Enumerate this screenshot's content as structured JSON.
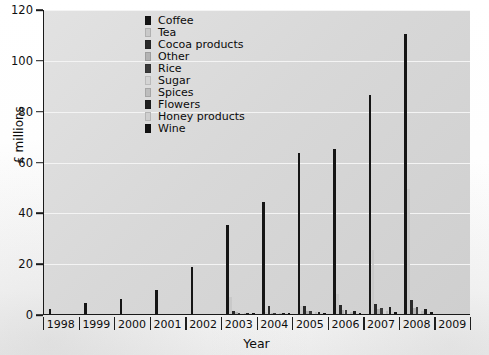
{
  "chart_data": {
    "type": "bar",
    "title": "",
    "subtitle": "",
    "xlabel": "Year",
    "ylabel": "£ millions",
    "ylim": [
      0,
      120
    ],
    "yticks": [
      0,
      20,
      40,
      60,
      80,
      100,
      120
    ],
    "grid": true,
    "legend_position": "top-left-inside",
    "categories": [
      "1998",
      "1999",
      "2000",
      "2001",
      "2002",
      "2003",
      "2004",
      "2005",
      "2006",
      "2007",
      "2008",
      "2009"
    ],
    "series": [
      {
        "name": "Coffee",
        "color": "#151515",
        "values": [
          2.0,
          4.5,
          6.0,
          9.5,
          18.5,
          35.0,
          44.0,
          63.5,
          65.0,
          86.0,
          110.0,
          0
        ]
      },
      {
        "name": "Tea",
        "color": "#c9c9c9",
        "values": [
          0,
          0,
          0,
          0,
          0,
          6.8,
          0.8,
          3.0,
          8.0,
          25.0,
          49.0,
          0
        ]
      },
      {
        "name": "Cocoa products",
        "color": "#2a2a2a",
        "values": [
          0,
          0,
          0,
          0,
          0,
          1.2,
          3.2,
          3.0,
          3.4,
          4.0,
          5.5,
          0
        ]
      },
      {
        "name": "Other",
        "color": "#b3b3b3",
        "values": [
          0,
          0,
          0,
          0,
          0,
          0.6,
          0.5,
          1.0,
          1.4,
          2.0,
          2.4,
          0
        ]
      },
      {
        "name": "Rice",
        "color": "#3a3a3a",
        "values": [
          0,
          0,
          0,
          0,
          0,
          0.4,
          0.5,
          1.2,
          1.6,
          2.2,
          2.6,
          0
        ]
      },
      {
        "name": "Sugar",
        "color": "#d4d4d4",
        "values": [
          0,
          0,
          0,
          0,
          0,
          0.3,
          0.4,
          0.8,
          1.0,
          1.4,
          1.8,
          0
        ]
      },
      {
        "name": "Spices",
        "color": "#bdbdbd",
        "values": [
          0,
          0,
          0,
          0,
          0,
          0.2,
          0.3,
          0.6,
          0.8,
          1.0,
          1.3,
          0
        ]
      },
      {
        "name": "Flowers",
        "color": "#1f1f1f",
        "values": [
          0,
          0,
          0,
          0,
          0,
          0.2,
          0.3,
          0.6,
          1.2,
          2.6,
          2.0,
          0
        ]
      },
      {
        "name": "Honey products",
        "color": "#cfcfcf",
        "values": [
          0,
          0,
          0,
          0,
          0,
          0.1,
          0.2,
          0.4,
          0.5,
          0.7,
          0.9,
          0
        ]
      },
      {
        "name": "Wine",
        "color": "#121212",
        "values": [
          0,
          0,
          0,
          0,
          0,
          0.1,
          0.2,
          0.3,
          0.4,
          0.6,
          0.8,
          0
        ]
      }
    ]
  },
  "legend": {
    "items": [
      {
        "label": "Coffee"
      },
      {
        "label": "Tea"
      },
      {
        "label": "Cocoa products"
      },
      {
        "label": "Other"
      },
      {
        "label": "Rice"
      },
      {
        "label": "Sugar"
      },
      {
        "label": "Spices"
      },
      {
        "label": "Flowers"
      },
      {
        "label": "Honey products"
      },
      {
        "label": "Wine"
      }
    ]
  }
}
